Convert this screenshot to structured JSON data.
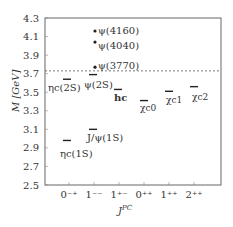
{
  "chart_data": {
    "type": "scatter",
    "title": "",
    "xlabel": "J^PC",
    "ylabel": "M [GeV]",
    "ylim": [
      2.5,
      4.3
    ],
    "yticks": [
      "2.5",
      "2.7",
      "2.9",
      "3.1",
      "3.3",
      "3.5",
      "3.7",
      "3.9",
      "4.1",
      "4.3"
    ],
    "categories": [
      "0⁻⁺",
      "1⁻⁻",
      "1⁺⁻",
      "0⁺⁺",
      "1⁺⁺",
      "2⁺⁺"
    ],
    "grid": false,
    "threshold_line": {
      "y": 3.73,
      "style": "dashed"
    },
    "levels": [
      {
        "name": "ηc(1S)",
        "category": "0⁻⁺",
        "mass": 2.98,
        "marker": "bar"
      },
      {
        "name": "ηc(2S)",
        "category": "0⁻⁺",
        "mass": 3.64,
        "marker": "bar"
      },
      {
        "name": "J/ψ(1S)",
        "category": "1⁻⁻",
        "mass": 3.1,
        "marker": "bar"
      },
      {
        "name": "ψ(2S)",
        "category": "1⁻⁻",
        "mass": 3.69,
        "marker": "bar"
      },
      {
        "name": "ψ(3770)",
        "category": "1⁻⁻",
        "mass": 3.77,
        "marker": "dot"
      },
      {
        "name": "ψ(4040)",
        "category": "1⁻⁻",
        "mass": 4.04,
        "marker": "dot"
      },
      {
        "name": "ψ(4160)",
        "category": "1⁻⁻",
        "mass": 4.16,
        "marker": "dot"
      },
      {
        "name": "hc",
        "category": "1⁺⁻",
        "mass": 3.53,
        "marker": "bar"
      },
      {
        "name": "χc0",
        "category": "0⁺⁺",
        "mass": 3.41,
        "marker": "bar"
      },
      {
        "name": "χc1",
        "category": "1⁺⁺",
        "mass": 3.51,
        "marker": "bar"
      },
      {
        "name": "χc2",
        "category": "2⁺⁺",
        "mass": 3.56,
        "marker": "bar"
      }
    ]
  },
  "labels": {
    "y_axis": "M [GeV]",
    "x_axis": "J",
    "x_axis_sup": "PC",
    "etac1s": "ηc(1S)",
    "etac2s": "ηc(2S)",
    "jpsi": "J/ψ(1S)",
    "psi2s": "ψ(2S)",
    "psi3770": "ψ(3770)",
    "psi4040": "ψ(4040)",
    "psi4160": "ψ(4160)",
    "hc": "hc",
    "chic0": "χc0",
    "chic1": "χc1",
    "chic2": "χc2"
  }
}
